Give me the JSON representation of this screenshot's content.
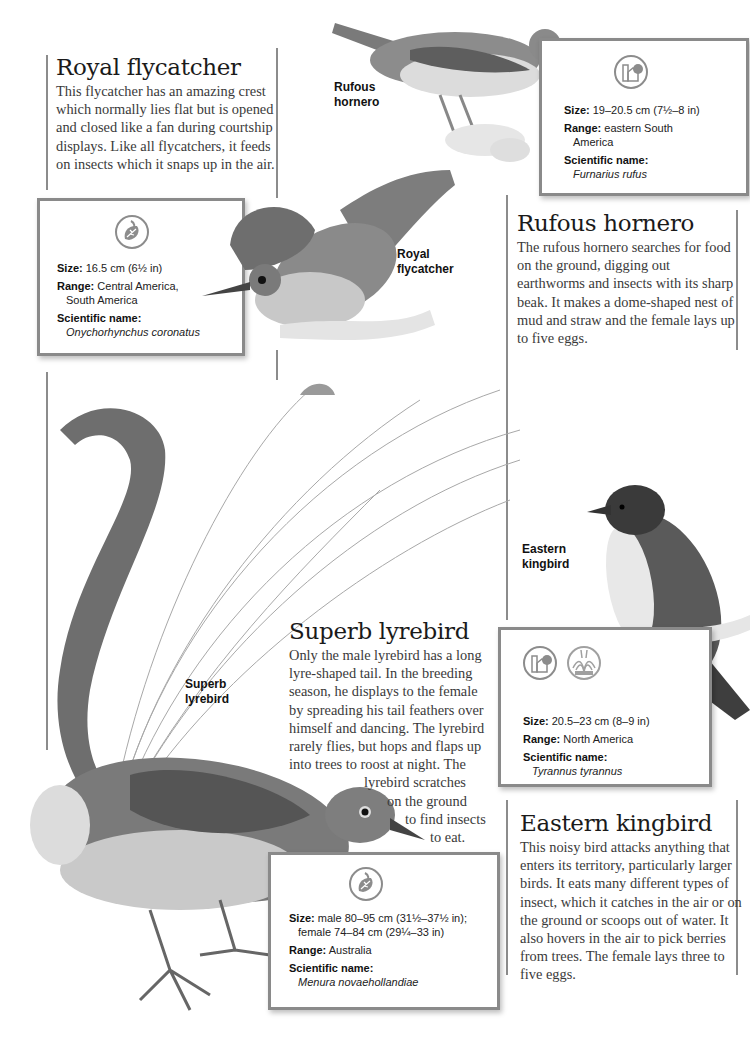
{
  "birds": {
    "royal_flycatcher": {
      "title": "Royal flycatcher",
      "description": "This flycatcher has an amazing crest which normally lies flat but is opened and closed like a fan during courtship displays. Like all flycatchers, it feeds on insects which it snaps up in the air.",
      "caption_line1": "Royal",
      "caption_line2": "flycatcher",
      "facts": {
        "habitat_icons": [
          "rainforest-leaf-icon"
        ],
        "size_label": "Size:",
        "size_value": "16.5 cm (6½ in)",
        "range_label": "Range:",
        "range_value_line1": "Central America,",
        "range_value_line2": "South America",
        "scientific_label": "Scientific name:",
        "scientific_value": "Onychorhynchus coronatus"
      }
    },
    "rufous_hornero": {
      "title": "Rufous hornero",
      "description": "The rufous hornero searches for food on the ground, digging out earthworms and insects with its sharp beak. It makes a dome-shaped nest of mud and straw and the female lays up to five eggs.",
      "caption_line1": "Rufous",
      "caption_line2": "hornero",
      "facts": {
        "habitat_icons": [
          "farmland-icon"
        ],
        "size_label": "Size:",
        "size_value": "19–20.5 cm (7½–8 in)",
        "range_label": "Range:",
        "range_value_line1": "eastern South",
        "range_value_line2": "America",
        "scientific_label": "Scientific name:",
        "scientific_value": "Furnarius rufus"
      }
    },
    "superb_lyrebird": {
      "title": "Superb lyrebird",
      "description_lines": [
        "Only the male lyrebird has a long",
        "lyre-shaped tail. In the breeding",
        "season, he displays to the female",
        "by spreading his tail feathers over",
        "himself and dancing. The lyrebird",
        "rarely flies, but hops and flaps up",
        "into trees to roost at night. The",
        "lyrebird scratches",
        "on the ground",
        "to find insects",
        "to eat."
      ],
      "caption_line1": "Superb",
      "caption_line2": "lyrebird",
      "facts": {
        "habitat_icons": [
          "rainforest-leaf-icon"
        ],
        "size_label": "Size:",
        "size_value_line1": "male 80–95 cm (31½–37½ in);",
        "size_value_line2": "female 74–84 cm (29¼–33 in)",
        "range_label": "Range:",
        "range_value": "Australia",
        "scientific_label": "Scientific name:",
        "scientific_value": "Menura novaehollandiae"
      }
    },
    "eastern_kingbird": {
      "title": "Eastern kingbird",
      "description": "This noisy bird attacks anything that enters its territory, particularly larger birds. It eats many different types of insect, which it catches in the air or on the ground or scoops out of water. It also hovers in the air to pick berries from trees. The female lays three to five eggs.",
      "caption_line1": "Eastern",
      "caption_line2": "kingbird",
      "facts": {
        "habitat_icons": [
          "farmland-icon",
          "wetland-icon"
        ],
        "size_label": "Size:",
        "size_value": "20.5–23 cm (8–9 in)",
        "range_label": "Range:",
        "range_value": "North America",
        "scientific_label": "Scientific name:",
        "scientific_value": "Tyrannus tyrannus"
      }
    }
  },
  "colors": {
    "rule_gray": "#8c8c8c",
    "box_border": "#8a8a8a",
    "title_text": "#1a1a1a",
    "body_text": "#3a3a3a",
    "icon_gray": "#8c8c8c"
  }
}
